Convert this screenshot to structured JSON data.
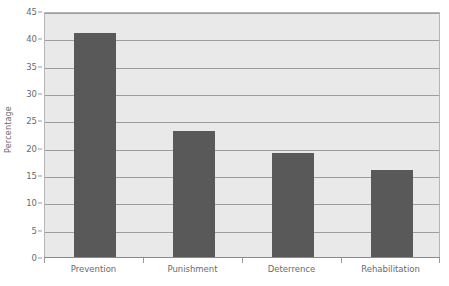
{
  "chart_data": {
    "type": "bar",
    "title": "",
    "subtitle": "",
    "xlabel": "",
    "ylabel": "Percentage",
    "categories": [
      "Prevention",
      "Punishment",
      "Deterrence",
      "Rehabilitation"
    ],
    "values": [
      41,
      23,
      19,
      16
    ],
    "series": [
      {
        "name": "Percentage",
        "values": [
          41,
          23,
          19,
          16
        ]
      }
    ],
    "ylim": [
      0,
      45
    ],
    "ytick_step": 5,
    "ytick_labels": [
      "0",
      "5",
      "10",
      "15",
      "20",
      "25",
      "30",
      "35",
      "40",
      "45"
    ],
    "ytick_values": [
      0,
      5,
      10,
      15,
      20,
      25,
      30,
      35,
      40,
      45
    ],
    "grid": true,
    "grid_axis": "y",
    "legend": false,
    "legend_position": "none",
    "annotations": [],
    "colors": {
      "bar_fill": "#595959",
      "plot_background": "#e9e9e9",
      "figure_background": "#ffffff",
      "gridline": "#9d9d9d",
      "axis_line": "#8a8a8a",
      "plot_border": "#b6b6b6",
      "tick_label_text": "#6b6b6b",
      "axis_title_text": "#6b6b6b"
    }
  }
}
